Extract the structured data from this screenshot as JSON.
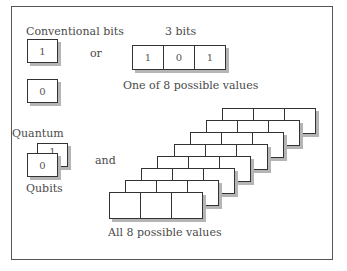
{
  "diagram": {
    "conventional": {
      "heading": "Conventional bits",
      "bit_one": "1",
      "bit_zero": "0",
      "connector": "or"
    },
    "three_bits": {
      "heading": "3 bits",
      "cells": [
        "1",
        "0",
        "1"
      ],
      "caption": "One of 8 possible values"
    },
    "quantum": {
      "heading": "Quantum",
      "back_value": "1",
      "front_value": "0",
      "caption": "Qubits",
      "connector": "and"
    },
    "superposition": {
      "register_count": 8,
      "cells_per_register": 3,
      "caption": "All 8 possible values"
    },
    "colors": {
      "border": "#333333",
      "shadow": "#b5b5b5",
      "text": "#4a4a4a",
      "frame": "#555555"
    }
  }
}
